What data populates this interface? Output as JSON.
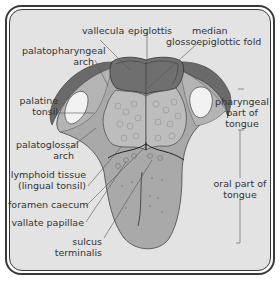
{
  "diagram": {
    "colors": {
      "background": "#e3e3e3",
      "frame": "#3a3a3a",
      "tongue_oral": "#a9a9a9",
      "tongue_pharyngeal": "#b4b4b4",
      "lingual_tonsil": "#bdbdbd",
      "epiglottis": "#6f6f6f",
      "palatopharyngeal_arch": "#6a6a6a",
      "palatine_tonsil": "#f2f2f2",
      "leader_line": "#555555",
      "text": "#333333"
    },
    "labels": {
      "vallecula": "vallecula",
      "epiglottis": "epiglottis",
      "median_fold_line1": "median",
      "median_fold_line2": "glossoepiglottic fold",
      "palatopharyngeal_line1": "palatopharyngeal",
      "palatopharyngeal_line2": "arch",
      "palatine_line1": "palatine",
      "palatine_line2": "tonsil",
      "palatoglossal_line1": "palatoglossal",
      "palatoglossal_line2": "arch",
      "lymphoid_line1": "lymphoid tissue",
      "lymphoid_line2": "(lingual tonsil)",
      "foramen_caecum": "foramen caecum",
      "vallate_papillae": "vallate papillae",
      "sulcus_line1": "sulcus",
      "sulcus_line2": "terminalis",
      "pharyngeal_part_line1": "pharyngeal",
      "pharyngeal_part_line2": "part of",
      "pharyngeal_part_line3": "tongue",
      "oral_part_line1": "oral part of",
      "oral_part_line2": "tongue"
    }
  }
}
